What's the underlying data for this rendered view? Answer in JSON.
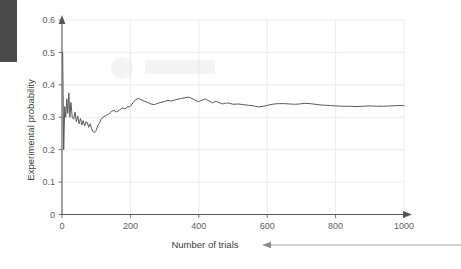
{
  "chart_data": {
    "type": "line",
    "title": "",
    "xlabel": "Number of trials",
    "ylabel": "Experimental probability",
    "xlim": [
      0,
      1000
    ],
    "ylim": [
      0,
      0.6
    ],
    "grid": true,
    "legend": "none",
    "x_ticks": [
      "0",
      "200",
      "400",
      "600",
      "800",
      "1000"
    ],
    "x_tick_values": [
      0,
      200,
      400,
      600,
      800,
      1000
    ],
    "y_ticks": [
      "0",
      "0.1",
      "0.2",
      "0.3",
      "0.4",
      "0.5",
      "0.6"
    ],
    "y_tick_values": [
      0,
      0.1,
      0.2,
      0.3,
      0.4,
      0.5,
      0.6
    ],
    "series": [
      {
        "name": "Experimental probability",
        "color": "#5a5a5a",
        "x": [
          2,
          5,
          8,
          11,
          14,
          17,
          20,
          23,
          26,
          30,
          34,
          38,
          42,
          46,
          50,
          54,
          58,
          62,
          66,
          70,
          74,
          78,
          82,
          86,
          90,
          95,
          100,
          105,
          110,
          115,
          120,
          128,
          136,
          144,
          152,
          160,
          168,
          176,
          184,
          192,
          200,
          208,
          216,
          224,
          232,
          240,
          250,
          260,
          270,
          280,
          290,
          300,
          310,
          320,
          330,
          340,
          350,
          360,
          370,
          380,
          390,
          400,
          410,
          420,
          430,
          440,
          450,
          460,
          470,
          480,
          490,
          500,
          515,
          530,
          545,
          560,
          575,
          590,
          605,
          620,
          635,
          650,
          665,
          680,
          695,
          710,
          725,
          740,
          755,
          770,
          785,
          800,
          820,
          840,
          860,
          880,
          900,
          920,
          940,
          960,
          980,
          1000
        ],
        "y": [
          0.5,
          0.2,
          0.333,
          0.3,
          0.357,
          0.312,
          0.375,
          0.3,
          0.346,
          0.3,
          0.294,
          0.316,
          0.286,
          0.304,
          0.28,
          0.296,
          0.276,
          0.29,
          0.273,
          0.286,
          0.284,
          0.269,
          0.28,
          0.267,
          0.256,
          0.253,
          0.26,
          0.275,
          0.282,
          0.296,
          0.3,
          0.305,
          0.309,
          0.318,
          0.321,
          0.316,
          0.322,
          0.329,
          0.326,
          0.331,
          0.334,
          0.345,
          0.355,
          0.358,
          0.354,
          0.35,
          0.346,
          0.341,
          0.339,
          0.343,
          0.346,
          0.349,
          0.352,
          0.35,
          0.353,
          0.356,
          0.358,
          0.36,
          0.362,
          0.358,
          0.352,
          0.348,
          0.353,
          0.356,
          0.35,
          0.345,
          0.349,
          0.345,
          0.341,
          0.344,
          0.343,
          0.34,
          0.341,
          0.339,
          0.337,
          0.335,
          0.332,
          0.334,
          0.338,
          0.341,
          0.342,
          0.342,
          0.341,
          0.34,
          0.341,
          0.343,
          0.342,
          0.34,
          0.338,
          0.337,
          0.336,
          0.335,
          0.334,
          0.334,
          0.333,
          0.334,
          0.335,
          0.334,
          0.334,
          0.335,
          0.336,
          0.336
        ]
      }
    ]
  },
  "annotation": {
    "arrow_label": "Number of trials"
  }
}
